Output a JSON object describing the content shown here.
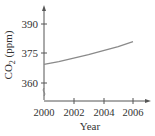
{
  "chart_data": {
    "type": "line",
    "title": "",
    "xlabel": "Year",
    "ylabel": "CO2 (ppm)",
    "ylabel_parts": {
      "main": "CO",
      "sub": "2",
      "rest": " (ppm)"
    },
    "x_ticks": [
      "2000",
      "2002",
      "2004",
      "2006"
    ],
    "y_ticks": [
      "360",
      "375",
      "390"
    ],
    "xlim": [
      2000,
      2006
    ],
    "ylim": [
      360,
      390
    ],
    "y_axis_break": true,
    "grid": false,
    "series": [
      {
        "name": "CO2 concentration",
        "x": [
          2000,
          2001,
          2002,
          2003,
          2004,
          2005,
          2006
        ],
        "values": [
          369.5,
          370.9,
          372.6,
          374.4,
          376.4,
          378.5,
          381.0
        ]
      }
    ],
    "colors": {
      "line": "#8a8a8a",
      "axis": "#555555"
    }
  }
}
